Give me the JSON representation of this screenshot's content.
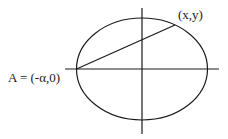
{
  "figure": {
    "type": "ellipse-with-chord",
    "stroke_color": "#1a1a1a",
    "background": "#ffffff"
  },
  "labels": {
    "point_A": "A = (-α,0)",
    "point_xy": "(x,y)"
  },
  "geometry": {
    "ellipse": {
      "cx": 142,
      "cy": 69,
      "rx": 65.5,
      "ry": 51
    },
    "x_axis": {
      "x1": 65,
      "y1": 69,
      "x2": 219,
      "y2": 69
    },
    "y_axis": {
      "x1": 142,
      "y1": 8,
      "x2": 142,
      "y2": 134
    },
    "chord": {
      "x1": 76.5,
      "y1": 69,
      "x2": 175,
      "y2": 25
    }
  }
}
